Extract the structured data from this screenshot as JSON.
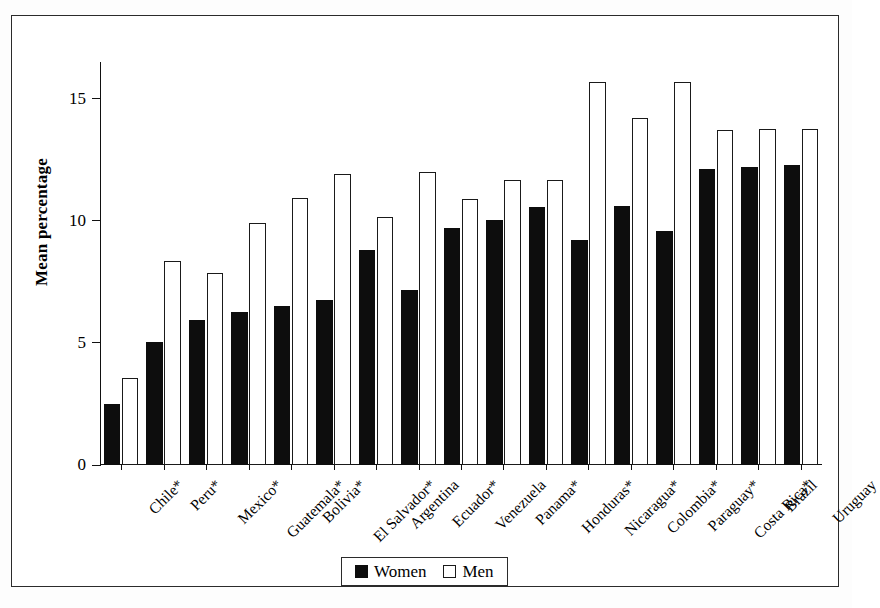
{
  "figure": {
    "y_axis_title": "Mean percentage"
  },
  "legend": {
    "items": [
      {
        "label": "Women",
        "style": "filled",
        "swatch_name": "legend-swatch-women"
      },
      {
        "label": "Men",
        "style": "open",
        "swatch_name": "legend-swatch-men"
      }
    ]
  },
  "chart_data": {
    "type": "bar",
    "title": "",
    "xlabel": "",
    "ylabel": "Mean percentage",
    "ylim": [
      0,
      16.5
    ],
    "yticks": [
      0,
      5,
      10,
      15
    ],
    "ytick_labels": [
      "0",
      "5",
      "10",
      "15"
    ],
    "grid": false,
    "legend_position": "bottom-center",
    "categories": [
      "Chile*",
      "Peru*",
      "Mexico*",
      "Guatemala*",
      "Bolivia*",
      "El Salvador*",
      "Argentina",
      "Ecuador*",
      "Venezuela",
      "Panama*",
      "Honduras*",
      "Nicaragua*",
      "Colombia*",
      "Paraguay*",
      "Costa Rica*",
      "Brazil",
      "Uruguay"
    ],
    "series": [
      {
        "name": "Women",
        "color": "#0d0d0d",
        "values": [
          2.5,
          5.05,
          5.95,
          6.25,
          6.5,
          6.75,
          8.8,
          7.15,
          9.7,
          10.05,
          10.55,
          9.2,
          10.6,
          9.6,
          12.1,
          12.2,
          12.3
        ]
      },
      {
        "name": "Men",
        "color": "#ffffff",
        "values": [
          3.55,
          8.35,
          7.85,
          9.9,
          10.95,
          11.9,
          10.15,
          12.0,
          10.9,
          11.65,
          11.65,
          15.7,
          14.2,
          15.7,
          13.7,
          13.75,
          13.75
        ]
      }
    ]
  }
}
